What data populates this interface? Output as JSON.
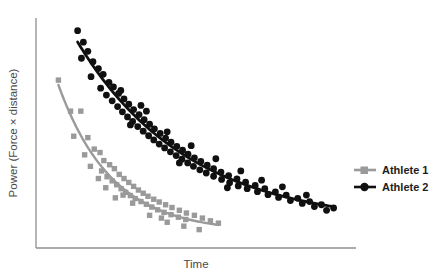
{
  "chart_data": {
    "type": "scatter",
    "title": "",
    "subtitle": "",
    "xlabel": "Time",
    "ylabel": "Power (Force × distance)",
    "xlim": [
      0,
      10
    ],
    "ylim": [
      0,
      10
    ],
    "grid": false,
    "axis_ticks": "none",
    "legend_position": "right",
    "annotations": [],
    "series": [
      {
        "name": "Athlete 1",
        "color": "#9a9a9a",
        "marker": "square",
        "fit": "exponential decay",
        "fit_description": "Power declines steeply and plateaus early, ending mid-range on the time axis",
        "points": [
          [
            0.7,
            7.3
          ],
          [
            1.08,
            5.95
          ],
          [
            1.4,
            5.95
          ],
          [
            1.18,
            4.86
          ],
          [
            1.62,
            4.8
          ],
          [
            1.82,
            4.3
          ],
          [
            1.52,
            4.05
          ],
          [
            2.0,
            4.15
          ],
          [
            2.12,
            3.8
          ],
          [
            1.7,
            3.55
          ],
          [
            2.3,
            3.62
          ],
          [
            2.05,
            3.35
          ],
          [
            2.45,
            3.45
          ],
          [
            2.22,
            3.1
          ],
          [
            2.6,
            3.2
          ],
          [
            2.38,
            2.92
          ],
          [
            2.75,
            3.02
          ],
          [
            2.52,
            2.75
          ],
          [
            2.9,
            2.85
          ],
          [
            2.66,
            2.58
          ],
          [
            3.05,
            2.68
          ],
          [
            2.8,
            2.42
          ],
          [
            3.2,
            2.52
          ],
          [
            2.95,
            2.28
          ],
          [
            3.35,
            2.38
          ],
          [
            3.1,
            2.15
          ],
          [
            3.5,
            2.25
          ],
          [
            3.28,
            2.02
          ],
          [
            3.68,
            2.12
          ],
          [
            3.45,
            1.9
          ],
          [
            3.85,
            2.0
          ],
          [
            3.62,
            1.78
          ],
          [
            4.05,
            1.88
          ],
          [
            3.8,
            1.66
          ],
          [
            4.25,
            1.76
          ],
          [
            4.0,
            1.55
          ],
          [
            4.48,
            1.64
          ],
          [
            4.22,
            1.45
          ],
          [
            4.7,
            1.52
          ],
          [
            4.45,
            1.34
          ],
          [
            4.95,
            1.42
          ],
          [
            4.68,
            1.24
          ],
          [
            5.2,
            1.3
          ],
          [
            5.45,
            1.18
          ],
          [
            5.7,
            1.08
          ],
          [
            2.48,
            2.18
          ],
          [
            3.02,
            1.95
          ],
          [
            3.55,
            1.42
          ],
          [
            4.1,
            1.12
          ],
          [
            4.62,
            0.95
          ],
          [
            5.1,
            0.8
          ],
          [
            2.18,
            2.62
          ],
          [
            2.72,
            2.3
          ],
          [
            1.95,
            3.02
          ],
          [
            3.92,
            1.3
          ]
        ]
      },
      {
        "name": "Athlete 2",
        "color": "#101010",
        "marker": "circle",
        "fit": "exponential decay",
        "fit_description": "Power declines more gradually, sustaining output far longer across the time axis",
        "points": [
          [
            1.3,
            9.45
          ],
          [
            1.48,
            8.95
          ],
          [
            1.62,
            8.55
          ],
          [
            1.42,
            8.25
          ],
          [
            1.78,
            8.1
          ],
          [
            1.95,
            7.8
          ],
          [
            1.72,
            7.45
          ],
          [
            2.1,
            7.55
          ],
          [
            2.28,
            7.2
          ],
          [
            2.02,
            6.95
          ],
          [
            2.42,
            7.0
          ],
          [
            2.2,
            6.65
          ],
          [
            2.58,
            6.72
          ],
          [
            2.38,
            6.4
          ],
          [
            2.75,
            6.48
          ],
          [
            2.55,
            6.15
          ],
          [
            2.9,
            6.25
          ],
          [
            2.7,
            5.92
          ],
          [
            3.05,
            6.02
          ],
          [
            2.86,
            5.7
          ],
          [
            3.22,
            5.8
          ],
          [
            3.02,
            5.5
          ],
          [
            3.38,
            5.58
          ],
          [
            3.18,
            5.28
          ],
          [
            3.55,
            5.38
          ],
          [
            3.35,
            5.08
          ],
          [
            3.7,
            5.18
          ],
          [
            3.52,
            4.88
          ],
          [
            3.88,
            4.98
          ],
          [
            3.68,
            4.7
          ],
          [
            4.05,
            4.78
          ],
          [
            3.85,
            4.52
          ],
          [
            4.22,
            4.6
          ],
          [
            4.02,
            4.35
          ],
          [
            4.4,
            4.42
          ],
          [
            4.2,
            4.18
          ],
          [
            4.58,
            4.25
          ],
          [
            4.38,
            4.02
          ],
          [
            4.75,
            4.08
          ],
          [
            4.56,
            3.86
          ],
          [
            4.95,
            3.92
          ],
          [
            4.74,
            3.7
          ],
          [
            5.15,
            3.76
          ],
          [
            4.92,
            3.55
          ],
          [
            5.35,
            3.6
          ],
          [
            5.12,
            3.4
          ],
          [
            5.55,
            3.45
          ],
          [
            5.32,
            3.26
          ],
          [
            5.78,
            3.3
          ],
          [
            5.55,
            3.12
          ],
          [
            6.02,
            3.15
          ],
          [
            5.8,
            2.98
          ],
          [
            6.28,
            3.0
          ],
          [
            6.05,
            2.84
          ],
          [
            6.55,
            2.86
          ],
          [
            6.32,
            2.7
          ],
          [
            6.85,
            2.72
          ],
          [
            6.6,
            2.58
          ],
          [
            7.15,
            2.58
          ],
          [
            6.92,
            2.45
          ],
          [
            7.48,
            2.44
          ],
          [
            7.25,
            2.32
          ],
          [
            7.82,
            2.3
          ],
          [
            7.58,
            2.2
          ],
          [
            8.18,
            2.16
          ],
          [
            7.95,
            2.06
          ],
          [
            8.55,
            2.02
          ],
          [
            8.32,
            1.94
          ],
          [
            8.92,
            1.88
          ],
          [
            8.7,
            1.8
          ],
          [
            9.3,
            1.74
          ],
          [
            9.08,
            1.64
          ],
          [
            3.45,
            5.95
          ],
          [
            4.1,
            5.05
          ],
          [
            4.85,
            4.45
          ],
          [
            5.62,
            3.88
          ],
          [
            6.4,
            3.35
          ],
          [
            7.05,
            2.95
          ],
          [
            7.7,
            2.66
          ],
          [
            8.45,
            2.3
          ],
          [
            2.65,
            6.85
          ],
          [
            3.28,
            6.2
          ],
          [
            2.95,
            5.35
          ],
          [
            4.48,
            3.7
          ],
          [
            5.98,
            2.62
          ]
        ]
      }
    ]
  },
  "legend": {
    "items": [
      {
        "label": "Athlete 1",
        "color": "#9a9a9a",
        "marker": "square"
      },
      {
        "label": "Athlete 2",
        "color": "#101010",
        "marker": "circle"
      }
    ]
  },
  "axes": {
    "x_title": "Time",
    "y_title": "Power (Force × distance)",
    "line_color": "#8f8f8f"
  }
}
